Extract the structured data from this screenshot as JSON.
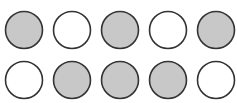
{
  "diagram": {
    "type": "circle-grid",
    "rows": 2,
    "columns": 5,
    "colors": {
      "filled": "#c8c8c8",
      "empty": "#ffffff",
      "stroke": "#333333"
    },
    "grid": [
      [
        "filled",
        "empty",
        "filled",
        "empty",
        "filled"
      ],
      [
        "empty",
        "filled",
        "filled",
        "filled",
        "empty"
      ]
    ],
    "counts": {
      "filled": 6,
      "empty": 4,
      "total": 10
    }
  }
}
